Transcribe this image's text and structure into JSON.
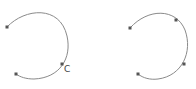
{
  "canvas": {
    "width": 196,
    "height": 89,
    "background": "#ffffff"
  },
  "colors": {
    "stroke": "#8a8a8a",
    "handle": "#555555"
  },
  "shapes": [
    {
      "name": "left-arc",
      "path": "M 7 27 C 25 8, 60 5, 67 36 C 72 58, 60 78, 34 79 C 26 79, 20 77, 16 74",
      "handles": [
        {
          "x": 7,
          "y": 27
        },
        {
          "x": 62,
          "y": 64
        },
        {
          "x": 16,
          "y": 74
        }
      ],
      "label": {
        "text": "C",
        "x": 64,
        "y": 72
      }
    },
    {
      "name": "right-arc",
      "path": "M 130 28 C 148 8, 176 8, 185 30 C 193 52, 182 76, 158 79 C 150 80, 143 78, 138 74",
      "handles": [
        {
          "x": 130,
          "y": 28
        },
        {
          "x": 176,
          "y": 20
        },
        {
          "x": 184,
          "y": 64
        },
        {
          "x": 138,
          "y": 74
        }
      ]
    }
  ]
}
